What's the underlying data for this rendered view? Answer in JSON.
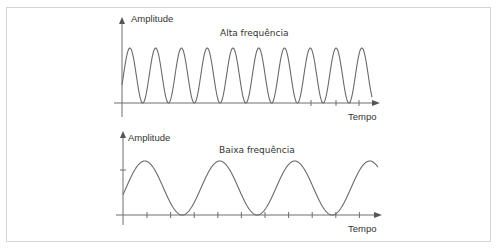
{
  "colors": {
    "background": "#ffffff",
    "frame": "#d4d4d4",
    "axis": "#6e6e6e",
    "wave": "#6a6a6a",
    "text": "#333333"
  },
  "panels": [
    {
      "id": "high",
      "title": "Alta frequência",
      "y_label": "Amplitude",
      "x_label": "Tempo",
      "cycles_shown": 9.7,
      "relative_frequency": "high"
    },
    {
      "id": "low",
      "title": "Baixa frequência",
      "y_label": "Amplitude",
      "x_label": "Tempo",
      "cycles_shown": 3.4,
      "relative_frequency": "low"
    }
  ]
}
